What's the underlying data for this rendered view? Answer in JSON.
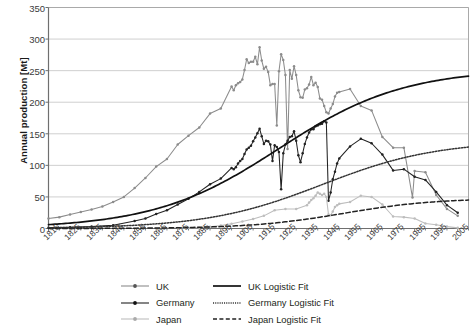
{
  "chart_data": {
    "type": "line",
    "xlabel": "",
    "ylabel": "Annual production [Mt]",
    "ylim": [
      0,
      350
    ],
    "yticks": [
      0,
      50,
      100,
      150,
      200,
      250,
      300,
      350
    ],
    "xlim": [
      1815,
      2010
    ],
    "xticks": [
      1815,
      1825,
      1835,
      1845,
      1855,
      1865,
      1875,
      1885,
      1895,
      1905,
      1915,
      1925,
      1935,
      1945,
      1955,
      1965,
      1975,
      1985,
      1995,
      2005
    ],
    "grid": "horizontal",
    "legend_position": "bottom",
    "colors": {
      "uk": "#8c8c8c",
      "germany": "#222222",
      "japan": "#bdbdbd",
      "uk_fit": "#111111",
      "germany_fit": "#333333",
      "japan_fit": "#222222",
      "grid": "#c9c9c9",
      "axis": "#8d8d8d"
    },
    "series": [
      {
        "name": "UK",
        "color_key": "uk",
        "style": "line-markers",
        "x": [
          1815,
          1820,
          1825,
          1830,
          1835,
          1840,
          1845,
          1850,
          1855,
          1860,
          1865,
          1870,
          1875,
          1880,
          1885,
          1890,
          1895,
          1900,
          1901,
          1902,
          1903,
          1904,
          1905,
          1906,
          1907,
          1908,
          1909,
          1910,
          1911,
          1912,
          1913,
          1914,
          1915,
          1916,
          1917,
          1918,
          1919,
          1920,
          1921,
          1922,
          1923,
          1924,
          1925,
          1926,
          1927,
          1928,
          1929,
          1930,
          1931,
          1932,
          1933,
          1934,
          1935,
          1936,
          1937,
          1938,
          1939,
          1940,
          1941,
          1942,
          1943,
          1944,
          1945,
          1946,
          1947,
          1948,
          1949,
          1950,
          1955,
          1960,
          1965,
          1970,
          1975,
          1980,
          1984,
          1985,
          1990,
          1995,
          2000,
          2005
        ],
        "values": [
          16,
          18,
          22,
          26,
          30,
          35,
          42,
          50,
          64,
          80,
          98,
          110,
          133,
          147,
          160,
          182,
          190,
          225,
          219,
          227,
          230,
          232,
          236,
          251,
          268,
          262,
          264,
          264,
          272,
          260,
          287,
          266,
          253,
          256,
          248,
          227,
          229,
          229,
          163,
          249,
          276,
          267,
          243,
          126,
          251,
          237,
          257,
          243,
          219,
          208,
          207,
          220,
          222,
          228,
          240,
          227,
          231,
          224,
          206,
          204,
          194,
          184,
          182,
          190,
          197,
          209,
          215,
          216,
          221,
          194,
          187,
          145,
          128,
          128,
          49,
          91,
          89,
          53,
          31,
          20
        ]
      },
      {
        "name": "Germany",
        "color_key": "germany",
        "style": "line-markers",
        "x": [
          1815,
          1825,
          1835,
          1845,
          1855,
          1860,
          1865,
          1870,
          1875,
          1880,
          1885,
          1890,
          1895,
          1900,
          1901,
          1902,
          1903,
          1904,
          1905,
          1906,
          1907,
          1908,
          1909,
          1910,
          1911,
          1912,
          1913,
          1914,
          1915,
          1916,
          1917,
          1918,
          1919,
          1920,
          1921,
          1922,
          1923,
          1924,
          1925,
          1926,
          1927,
          1928,
          1929,
          1930,
          1931,
          1932,
          1933,
          1934,
          1935,
          1936,
          1937,
          1938,
          1939,
          1940,
          1941,
          1942,
          1943,
          1944,
          1945,
          1946,
          1947,
          1948,
          1949,
          1950,
          1955,
          1960,
          1965,
          1970,
          1975,
          1980,
          1985,
          1990,
          1995,
          2000,
          2005
        ],
        "values": [
          1,
          2,
          3,
          5,
          12,
          16,
          23,
          29,
          38,
          47,
          58,
          70,
          79,
          96,
          94,
          97,
          103,
          107,
          110,
          118,
          125,
          128,
          131,
          138,
          144,
          151,
          158,
          146,
          134,
          139,
          138,
          133,
          107,
          132,
          129,
          121,
          62,
          119,
          133,
          139,
          145,
          146,
          154,
          139,
          116,
          105,
          119,
          134,
          144,
          152,
          157,
          157,
          162,
          163,
          165,
          166,
          170,
          168,
          44,
          57,
          78,
          90,
          103,
          111,
          130,
          142,
          135,
          117,
          92,
          94,
          82,
          77,
          58,
          37,
          25
        ]
      },
      {
        "name": "Japan",
        "color_key": "japan",
        "style": "line-markers",
        "x": [
          1875,
          1880,
          1885,
          1890,
          1895,
          1900,
          1905,
          1910,
          1915,
          1920,
          1925,
          1930,
          1935,
          1936,
          1937,
          1938,
          1939,
          1940,
          1941,
          1942,
          1943,
          1944,
          1945,
          1946,
          1947,
          1948,
          1949,
          1950,
          1955,
          1960,
          1965,
          1970,
          1975,
          1980,
          1985,
          1990,
          1995,
          2000,
          2005
        ],
        "values": [
          0.6,
          1,
          1.3,
          2.6,
          4.6,
          7.4,
          11,
          15,
          20,
          29,
          31,
          31,
          37,
          41,
          45,
          48,
          52,
          57,
          55,
          53,
          55,
          50,
          22,
          21,
          27,
          34,
          37,
          39,
          42,
          52,
          50,
          38,
          19,
          18,
          16,
          8,
          6,
          3,
          1
        ]
      },
      {
        "name": "UK Logistic Fit",
        "color_key": "uk_fit",
        "style": "solid",
        "fit": {
          "K": 253,
          "midpoint": 1922,
          "rate": 0.0345,
          "window": [
            1815,
            2010
          ]
        }
      },
      {
        "name": "Germany Logistic Fit",
        "color_key": "germany_fit",
        "style": "dotted",
        "fit": {
          "K": 139,
          "midpoint": 1942,
          "rate": 0.0375,
          "window": [
            1815,
            2010
          ]
        }
      },
      {
        "name": "Japan Logistic Fit",
        "color_key": "japan_fit",
        "style": "dashed",
        "fit": {
          "K": 48,
          "midpoint": 1952,
          "rate": 0.047,
          "window": [
            1815,
            2010
          ]
        }
      }
    ],
    "annotations": []
  },
  "axes": {
    "y_title": "Annual production [Mt]",
    "y_tick_labels": [
      "350",
      "300",
      "250",
      "200",
      "150",
      "100",
      "50",
      "0"
    ],
    "x_tick_labels": [
      "1815",
      "1825",
      "1835",
      "1845",
      "1855",
      "1865",
      "1875",
      "1885",
      "1895",
      "1905",
      "1915",
      "1925",
      "1935",
      "1945",
      "1955",
      "1965",
      "1975",
      "1985",
      "1995",
      "2005"
    ]
  },
  "legend": {
    "rows": [
      {
        "left_label": "UK",
        "left_key": "uk-marker-line",
        "right_label": "UK Logistic Fit",
        "right_key": "solid-line"
      },
      {
        "left_label": "Germany",
        "left_key": "germany-marker-line",
        "right_label": "Germany Logistic Fit",
        "right_key": "dotted-line"
      },
      {
        "left_label": "Japan",
        "left_key": "japan-marker-line",
        "right_label": "Japan Logistic Fit",
        "right_key": "dashed-line"
      }
    ]
  }
}
